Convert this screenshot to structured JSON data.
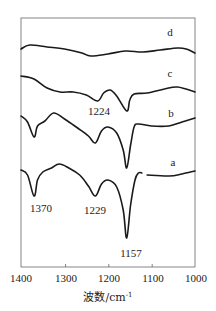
{
  "chart_data": {
    "type": "line",
    "title": "",
    "xlabel": "波数/cm⁻¹",
    "ylabel": "",
    "xlim": [
      1400,
      1000
    ],
    "x_reversed": true,
    "grid": false,
    "xticks": [
      1400,
      1300,
      1200,
      1100,
      1000
    ],
    "xtick_labels": [
      "1400",
      "1300",
      "1200",
      "1100",
      "1000"
    ],
    "series": [
      {
        "name": "d",
        "points": [
          [
            1400,
            49
          ],
          [
            1380,
            45
          ],
          [
            1340,
            47
          ],
          [
            1300,
            49
          ],
          [
            1260,
            53
          ],
          [
            1240,
            56
          ],
          [
            1200,
            54
          ],
          [
            1160,
            51
          ],
          [
            1120,
            52
          ],
          [
            1080,
            50
          ],
          [
            1040,
            48
          ],
          [
            1020,
            49
          ],
          [
            1000,
            53
          ]
        ]
      },
      {
        "name": "c",
        "points": [
          [
            1400,
            76
          ],
          [
            1370,
            79
          ],
          [
            1340,
            88
          ],
          [
            1310,
            92
          ],
          [
            1280,
            92
          ],
          [
            1250,
            95
          ],
          [
            1224,
            101
          ],
          [
            1210,
            93
          ],
          [
            1195,
            90
          ],
          [
            1180,
            96
          ],
          [
            1157,
            111
          ],
          [
            1150,
            100
          ],
          [
            1140,
            94
          ],
          [
            1110,
            93
          ],
          [
            1070,
            89
          ],
          [
            1040,
            87
          ],
          [
            1000,
            92
          ]
        ]
      },
      {
        "name": "b",
        "points": [
          [
            1400,
            116
          ],
          [
            1385,
            122
          ],
          [
            1370,
            137
          ],
          [
            1362,
            126
          ],
          [
            1345,
            121
          ],
          [
            1325,
            113
          ],
          [
            1300,
            119
          ],
          [
            1270,
            128
          ],
          [
            1245,
            136
          ],
          [
            1229,
            143
          ],
          [
            1215,
            131
          ],
          [
            1200,
            127
          ],
          [
            1180,
            133
          ],
          [
            1165,
            150
          ],
          [
            1157,
            168
          ],
          [
            1148,
            145
          ],
          [
            1140,
            127
          ],
          [
            1130,
            124
          ],
          [
            1100,
            126
          ],
          [
            1060,
            126
          ],
          [
            1030,
            122
          ],
          [
            1000,
            118
          ]
        ]
      },
      {
        "name": "a",
        "points": [
          [
            1400,
            170
          ],
          [
            1385,
            175
          ],
          [
            1370,
            196
          ],
          [
            1362,
            180
          ],
          [
            1350,
            172
          ],
          [
            1330,
            168
          ],
          [
            1312,
            164
          ],
          [
            1290,
            168
          ],
          [
            1265,
            175
          ],
          [
            1245,
            186
          ],
          [
            1229,
            196
          ],
          [
            1215,
            184
          ],
          [
            1200,
            180
          ],
          [
            1180,
            187
          ],
          [
            1165,
            210
          ],
          [
            1157,
            238
          ],
          [
            1148,
            205
          ],
          [
            1138,
            180
          ],
          [
            1130,
            173
          ],
          [
            1122,
            173
          ],
          [
            1110,
            175
          ],
          [
            1060,
            176
          ],
          [
            1030,
            174
          ],
          [
            1000,
            171
          ]
        ]
      }
    ],
    "annotations": [
      {
        "text": "d",
        "x": 1040,
        "y": 32
      },
      {
        "text": "c",
        "x": 1042,
        "y": 72
      },
      {
        "text": "1224",
        "x": 1236,
        "y": 111
      },
      {
        "text": "b",
        "x": 1040,
        "y": 113
      },
      {
        "text": "a",
        "x": 1040,
        "y": 162
      },
      {
        "text": "1370",
        "x": 1370,
        "y": 208
      },
      {
        "text": "1229",
        "x": 1233,
        "y": 210
      },
      {
        "text": "1157",
        "x": 1157,
        "y": 253
      }
    ],
    "y_units": "image-pixel offsets (transmittance, arbitrary)"
  },
  "labels": {
    "xlabel": "波数/cm",
    "xlabel_sup": "-1",
    "ticks": [
      "1400",
      "1300",
      "1200",
      "1100",
      "1000"
    ],
    "curve_d": "d",
    "curve_c": "c",
    "curve_b": "b",
    "curve_a": "a",
    "peak_1224": "1224",
    "peak_1370": "1370",
    "peak_1229": "1229",
    "peak_1157": "1157"
  },
  "colors": {
    "line": "#1a1a1a",
    "frame": "#555555",
    "background": "#ffffff"
  }
}
